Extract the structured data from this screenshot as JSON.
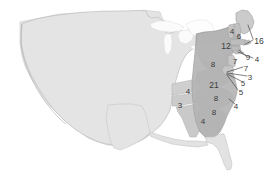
{
  "map": {
    "title": "United States choropleth map",
    "background_color": "#ffffff",
    "colors": {
      "unshaded_state": "#e4e4e4",
      "light_shaded_state": "#cfcfcf",
      "mid_shaded_state": "#c2c2c2",
      "dark_shaded_state": "#b3b3b3",
      "darker_shaded_state": "#a9a9a9",
      "water": "#f7f7f7",
      "border": "#b0b0b0",
      "outer_border": "#9a9a9a",
      "label_text": "#3a3a3a",
      "leader_line": "#3f3f3f"
    },
    "region_shaded": "eastern-and-southeastern-states"
  },
  "labels": [
    {
      "id": "maine",
      "value": "4",
      "x": 232,
      "y": 32,
      "leader": false
    },
    {
      "id": "new-hampshire",
      "value": "6",
      "x": 239,
      "y": 37,
      "leader": false
    },
    {
      "id": "vermont-massachusetts",
      "value": "16",
      "x": 259,
      "y": 41,
      "leader": true
    },
    {
      "id": "new-york",
      "value": "12",
      "x": 226,
      "y": 46,
      "leader": false
    },
    {
      "id": "rhode-island",
      "value": "9",
      "x": 248,
      "y": 58,
      "leader": true
    },
    {
      "id": "connecticut",
      "value": "4",
      "x": 257,
      "y": 60,
      "leader": true
    },
    {
      "id": "new-jersey",
      "value": "7",
      "x": 235,
      "y": 62,
      "leader": false
    },
    {
      "id": "pennsylvania",
      "value": "8",
      "x": 213,
      "y": 65,
      "leader": false
    },
    {
      "id": "delaware",
      "value": "7",
      "x": 246,
      "y": 69,
      "leader": true
    },
    {
      "id": "maryland",
      "value": "3",
      "x": 250,
      "y": 78,
      "leader": true
    },
    {
      "id": "dc",
      "value": "5",
      "x": 243,
      "y": 84,
      "leader": true
    },
    {
      "id": "virginia",
      "value": "21",
      "x": 214,
      "y": 85,
      "leader": false
    },
    {
      "id": "west-virginia",
      "value": "5",
      "x": 241,
      "y": 93,
      "leader": true
    },
    {
      "id": "kentucky",
      "value": "4",
      "x": 188,
      "y": 92,
      "leader": false
    },
    {
      "id": "tennessee",
      "value": "3",
      "x": 180,
      "y": 106,
      "leader": false
    },
    {
      "id": "north-carolina",
      "value": "8",
      "x": 216,
      "y": 99,
      "leader": false
    },
    {
      "id": "north-carolina-coast",
      "value": "4",
      "x": 236,
      "y": 107,
      "leader": true
    },
    {
      "id": "south-carolina",
      "value": "8",
      "x": 214,
      "y": 113,
      "leader": false
    },
    {
      "id": "georgia",
      "value": "4",
      "x": 203,
      "y": 122,
      "leader": false
    }
  ],
  "leader_lines": [
    {
      "id": "leader-vermont-mass",
      "x1": 248,
      "y1": 25,
      "x2": 253,
      "y2": 40
    },
    {
      "id": "leader-mass-2",
      "x1": 253,
      "y1": 40,
      "x2": 245,
      "y2": 45
    },
    {
      "id": "leader-rhode-island",
      "x1": 240,
      "y1": 51,
      "x2": 245,
      "y2": 56
    },
    {
      "id": "leader-connecticut",
      "x1": 238,
      "y1": 53,
      "x2": 252,
      "y2": 59
    },
    {
      "id": "leader-delaware",
      "x1": 227,
      "y1": 73,
      "x2": 243,
      "y2": 68
    },
    {
      "id": "leader-maryland",
      "x1": 227,
      "y1": 74,
      "x2": 247,
      "y2": 77
    },
    {
      "id": "leader-dc",
      "x1": 227,
      "y1": 75,
      "x2": 241,
      "y2": 82
    },
    {
      "id": "leader-west-virginia",
      "x1": 227,
      "y1": 76,
      "x2": 239,
      "y2": 91
    },
    {
      "id": "leader-nc-coast",
      "x1": 229,
      "y1": 100,
      "x2": 235,
      "y2": 105
    }
  ]
}
